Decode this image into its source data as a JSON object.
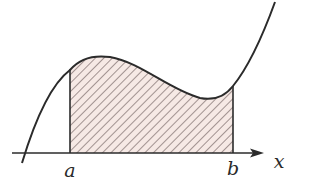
{
  "figure": {
    "labels": {
      "a": "a",
      "b": "b",
      "x_axis": "x"
    },
    "colors": {
      "curve": "#2b2b2b",
      "axis": "#2b2b2b",
      "hatch": "#5a4a4a",
      "fill": "#f6e9e5",
      "background": "#ffffff"
    }
  }
}
